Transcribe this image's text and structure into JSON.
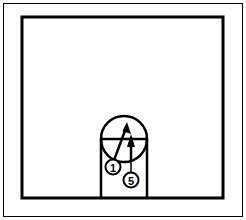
{
  "figure": {
    "background_color": "#ffffff",
    "line_color": "#000000",
    "outer_frame": {
      "label": "outer thin border frame",
      "x": 3,
      "y": 3,
      "width": 240,
      "height": 214,
      "stroke_width": 1
    },
    "inner_frame": {
      "label": "inner thick border rectangle",
      "x": 22,
      "y": 17,
      "width": 201,
      "height": 181,
      "stroke_width": 3
    },
    "chamber": {
      "label": "rounded-top chamber vessel",
      "circle_center_x": 124,
      "circle_center_y": 139,
      "circle_radius": 23,
      "left_wall_x": 101,
      "right_wall_x": 147,
      "wall_bottom_y": 198,
      "chord_y": 139,
      "stroke_width": 2.5
    },
    "arrows": [
      {
        "name": "long-diagonal-arrow",
        "from_x": 113,
        "from_y": 163,
        "to_x": 127,
        "to_y": 125,
        "stroke_width": 2.5
      },
      {
        "name": "short-vertical-arrow",
        "from_x": 131,
        "from_y": 160,
        "to_x": 131,
        "to_y": 136,
        "stroke_width": 2.5
      }
    ],
    "leader_lines": [
      {
        "name": "leader-line-to-5",
        "from_x": 131,
        "from_y": 160,
        "to_x": 131,
        "to_y": 172,
        "stroke_width": 1.5
      }
    ],
    "reference_numerals": [
      {
        "name": "reference-numeral-1",
        "label": "1",
        "cx": 113,
        "cy": 167,
        "r": 7.5,
        "stroke_width": 2
      },
      {
        "name": "reference-numeral-5",
        "label": "5",
        "cx": 131,
        "cy": 180,
        "r": 7.5,
        "stroke_width": 2
      }
    ]
  }
}
